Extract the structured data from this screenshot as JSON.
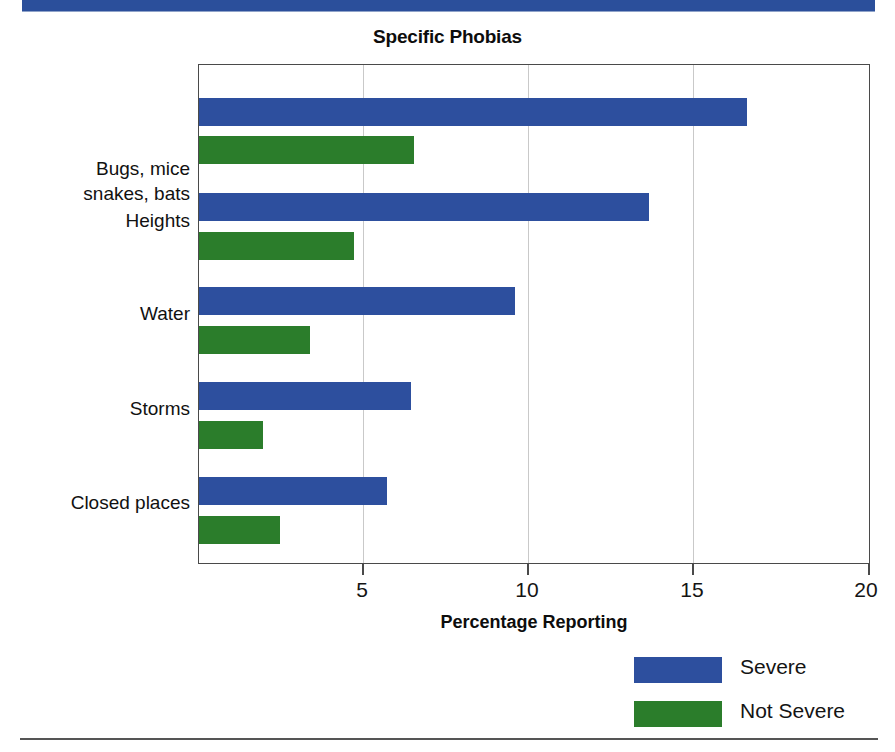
{
  "banner": {
    "color": "#2b4f9b"
  },
  "chart_data": {
    "type": "bar",
    "orientation": "horizontal",
    "title": "Specific Phobias",
    "xlabel": "Percentage Reporting",
    "ylabel": "",
    "xlim": [
      0,
      20
    ],
    "xticks": [
      5,
      10,
      15,
      20
    ],
    "xtick_labels": [
      "5",
      "10",
      "15",
      "20"
    ],
    "grid": "vertical-gridlines-at-xticks",
    "legend_position": "bottom-right",
    "categories": [
      "Bugs, mice\nsnakes, bats",
      "Heights",
      "Water",
      "Storms",
      "Closed places"
    ],
    "category_labels": [
      {
        "line1": "Bugs, mice",
        "line2": "snakes, bats"
      },
      {
        "line1": "Heights",
        "line2": ""
      },
      {
        "line1": "Water",
        "line2": ""
      },
      {
        "line1": "Storms",
        "line2": ""
      },
      {
        "line1": "Closed places",
        "line2": ""
      }
    ],
    "series": [
      {
        "name": "Severe",
        "color": "#2d4f9e",
        "values": [
          16.3,
          13.4,
          9.4,
          6.3,
          5.6
        ]
      },
      {
        "name": "Not Severe",
        "color": "#2b7d2b",
        "values": [
          6.4,
          4.6,
          3.3,
          1.9,
          2.4
        ]
      }
    ]
  },
  "legend": {
    "items": [
      {
        "label": "Severe",
        "color": "#2d4f9e"
      },
      {
        "label": "Not Severe",
        "color": "#2b7d2b"
      }
    ]
  }
}
